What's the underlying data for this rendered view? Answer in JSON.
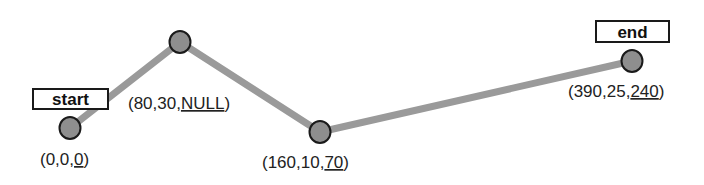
{
  "diagram": {
    "type": "path-with-waypoints",
    "colors": {
      "edge": "#9a9a9a",
      "node_fill": "#8e8e8e",
      "node_stroke": "#1a1a1a",
      "box_stroke": "#1a1a1a",
      "text": "#222222"
    },
    "nodes": [
      {
        "id": "n0",
        "cx": 70,
        "cy": 128,
        "label_prefix": "(0,0,",
        "label_underlined": "0",
        "label_suffix": ")",
        "label_x": 40,
        "label_y": 165
      },
      {
        "id": "n1",
        "cx": 180,
        "cy": 42,
        "label_prefix": "(80,30,",
        "label_underlined": "NULL",
        "label_suffix": ")",
        "label_x": 128,
        "label_y": 109
      },
      {
        "id": "n2",
        "cx": 320,
        "cy": 132,
        "label_prefix": "(160,10,",
        "label_underlined": "70",
        "label_suffix": ")",
        "label_x": 262,
        "label_y": 168
      },
      {
        "id": "n3",
        "cx": 632,
        "cy": 61,
        "label_prefix": "(390,25,",
        "label_underlined": "240",
        "label_suffix": ")",
        "label_x": 568,
        "label_y": 97
      }
    ],
    "tags": [
      {
        "id": "start",
        "text": "start",
        "x": 33,
        "y": 89,
        "w": 75,
        "h": 20
      },
      {
        "id": "end",
        "text": "end",
        "x": 596,
        "y": 21,
        "w": 73,
        "h": 21
      }
    ]
  }
}
